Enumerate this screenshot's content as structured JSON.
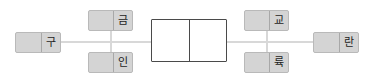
{
  "diagram": {
    "type": "flow-diagram",
    "canvas": {
      "width": 374,
      "height": 82,
      "background": "#ffffff"
    },
    "colors": {
      "node_fill": "#d4d4d4",
      "node_border": "#b9b9b9",
      "node_divider": "#a8a8a8",
      "center_fill": "#ffffff",
      "center_border": "#4a4a4a",
      "connector": "#d8d8d8",
      "text": "#1d1d1d"
    },
    "nodes": [
      {
        "id": "node-gu",
        "label": "구",
        "style": "gray",
        "x": 15,
        "y": 32,
        "w": 46,
        "h": 21
      },
      {
        "id": "node-geum",
        "label": "금",
        "style": "gray",
        "x": 88,
        "y": 10,
        "w": 45,
        "h": 21
      },
      {
        "id": "node-in",
        "label": "인",
        "style": "gray",
        "x": 88,
        "y": 52,
        "w": 45,
        "h": 21
      },
      {
        "id": "node-center",
        "label": "",
        "style": "white",
        "x": 151,
        "y": 19,
        "w": 76,
        "h": 43
      },
      {
        "id": "node-gyo",
        "label": "교",
        "style": "gray",
        "x": 244,
        "y": 10,
        "w": 45,
        "h": 21
      },
      {
        "id": "node-ryuk",
        "label": "륙",
        "style": "gray",
        "x": 244,
        "y": 52,
        "w": 45,
        "h": 21
      },
      {
        "id": "node-ran",
        "label": "란",
        "style": "gray",
        "x": 313,
        "y": 32,
        "w": 46,
        "h": 21
      }
    ],
    "connectors": [
      {
        "id": "conn-gu-center",
        "orientation": "horizontal",
        "x": 60,
        "y": 41,
        "length": 92
      },
      {
        "id": "conn-geum-in",
        "orientation": "vertical",
        "x": 110,
        "y": 30,
        "length": 23
      },
      {
        "id": "conn-center-ran",
        "orientation": "horizontal",
        "x": 226,
        "y": 41,
        "length": 88
      },
      {
        "id": "conn-gyo-ryuk",
        "orientation": "vertical",
        "x": 266,
        "y": 30,
        "length": 23
      }
    ]
  }
}
